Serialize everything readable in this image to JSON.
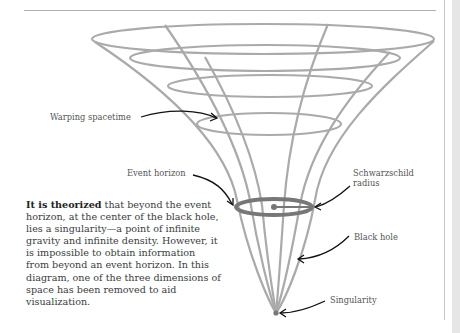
{
  "diagram": {
    "colors": {
      "grid": "#aaaaaa",
      "event_horizon": "#777777",
      "arrow": "#111111",
      "label": "#555555"
    },
    "labels": {
      "warping_spacetime": "Warping spacetime",
      "event_horizon": "Event horizon",
      "schwarzschild_line1": "Schwarzschild",
      "schwarzschild_line2": "radius",
      "black_hole": "Black hole",
      "singularity": "Singularity"
    }
  },
  "description": {
    "lead": "It is theorized",
    "body": " that beyond the event horizon, at the center of the black hole, lies a singularity—a point of infinite gravity and infinite density. However, it is impossible to obtain information from beyond an event horizon. In this diagram, one of the three dimensions of space has been removed to aid visualization."
  }
}
